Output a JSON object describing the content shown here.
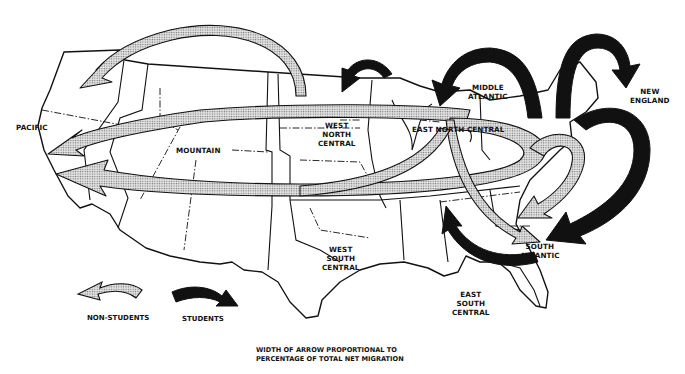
{
  "diagram": {
    "type": "flow-map",
    "regions": [
      {
        "id": "pacific",
        "label": "PACIFIC"
      },
      {
        "id": "mountain",
        "label": "MOUNTAIN"
      },
      {
        "id": "west_north_central",
        "label": "WEST\nNORTH\nCENTRAL"
      },
      {
        "id": "east_north_central",
        "label": "EAST NORTH CENTRAL"
      },
      {
        "id": "middle_atlantic",
        "label": "MIDDLE\nATLANTIC"
      },
      {
        "id": "new_england",
        "label": "NEW\nENGLAND"
      },
      {
        "id": "west_south_central",
        "label": "WEST\nSOUTH\nCENTRAL"
      },
      {
        "id": "east_south_central",
        "label": "EAST\nSOUTH\nCENTRAL"
      },
      {
        "id": "south_atlantic",
        "label": "SOUTH\nATLANTIC"
      }
    ],
    "flows": [
      {
        "group": "non-students",
        "from": "West North Central",
        "to": "Pacific (north)",
        "width": "medium"
      },
      {
        "group": "non-students",
        "from": "East North Central / Middle Atlantic",
        "to": "Pacific",
        "width": "medium"
      },
      {
        "group": "non-students",
        "from": "East North Central",
        "to": "Pacific",
        "width": "large"
      },
      {
        "group": "non-students",
        "from": "Middle Atlantic",
        "to": "South Atlantic",
        "width": "medium"
      },
      {
        "group": "non-students",
        "from": "East North Central",
        "to": "South Atlantic",
        "width": "medium"
      },
      {
        "group": "students",
        "from": "West North Central",
        "to": "East North Central",
        "width": "small"
      },
      {
        "group": "students",
        "from": "Middle Atlantic",
        "to": "East North Central",
        "width": "large"
      },
      {
        "group": "students",
        "from": "Middle Atlantic",
        "to": "New England",
        "width": "large"
      },
      {
        "group": "students",
        "from": "New England",
        "to": "South Atlantic",
        "width": "large"
      },
      {
        "group": "students",
        "from": "South Atlantic",
        "to": "East South Central",
        "width": "small"
      }
    ]
  },
  "legend": {
    "non_students": "NON-STUDENTS",
    "students": "STUDENTS"
  },
  "caption": {
    "line1": "WIDTH OF ARROW PROPORTIONAL TO",
    "line2": "PERCENTAGE OF TOTAL NET MIGRATION"
  },
  "colors": {
    "students_arrow": "#111111",
    "non_students_arrow": "#c8c8c8",
    "outline": "#111111",
    "background": "#ffffff"
  }
}
